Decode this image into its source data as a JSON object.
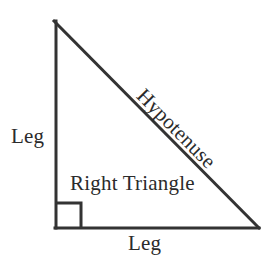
{
  "diagram": {
    "title": "Right Triangle",
    "type": "geometry-figure",
    "canvas": {
      "width": 275,
      "height": 263,
      "background": "#ffffff"
    },
    "stroke": {
      "color": "#333333",
      "width": 3
    },
    "text_color": "#2b2b2b",
    "vertices": {
      "apex": {
        "x": 54,
        "y": 21
      },
      "bottom_left": {
        "x": 55,
        "y": 228
      },
      "bottom_right": {
        "x": 259,
        "y": 228
      }
    },
    "right_angle_marker": {
      "name": "right-angle-square",
      "x": 56,
      "y": 203,
      "size": 25,
      "degrees": 90
    },
    "labels": {
      "leg_vertical": "Leg",
      "leg_horizontal": "Leg",
      "hypotenuse": "Hypotenuse",
      "figure_name": "Right Triangle"
    }
  }
}
